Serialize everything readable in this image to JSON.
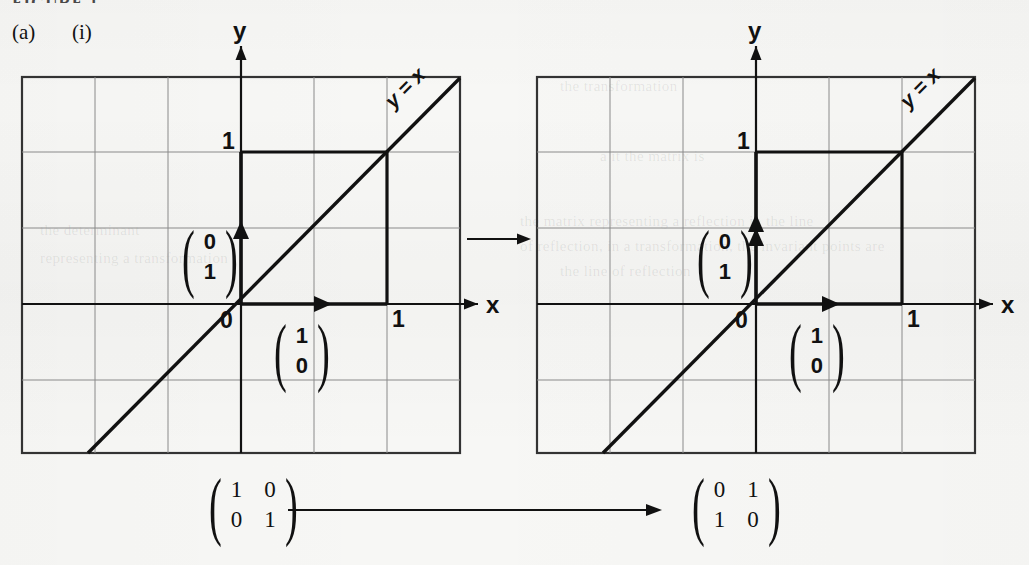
{
  "page": {
    "cropped_header": "FIGURE 1",
    "part_label": "(a)",
    "sub_label": "(i)",
    "background_color": "#f7f7f5",
    "ink_color": "#111111",
    "grid_color": "#8a8a8a"
  },
  "bleed_text": [
    {
      "text": "the transformation",
      "x": 560,
      "y": 78
    },
    {
      "text": "a it the matrix is",
      "x": 600,
      "y": 148
    },
    {
      "text": "the  matrix  representing  a  reflection  in  the  line",
      "x": 520,
      "y": 213
    },
    {
      "text": "of  reflection,  in  a  transformation,  the  invariant  points  are",
      "x": 520,
      "y": 238
    },
    {
      "text": "the  line  of  reflection",
      "x": 560,
      "y": 263
    },
    {
      "text": "the  determinant",
      "x": 40,
      "y": 222
    },
    {
      "text": "representing  a  transformation",
      "x": 40,
      "y": 250
    }
  ],
  "panels": [
    {
      "name": "identity-graph",
      "axis_x_label": "x",
      "axis_y_label": "y",
      "origin_label": "0",
      "x_tick_label": "1",
      "y_tick_label": "1",
      "line_label": "y = x",
      "vectors": [
        {
          "name": "i-hat",
          "label_top": "1",
          "label_bottom": "0",
          "dx": 1,
          "dy": 0
        },
        {
          "name": "j-hat",
          "label_top": "0",
          "label_bottom": "1",
          "dx": 0,
          "dy": 1
        }
      ],
      "unit_square": {
        "x": 1,
        "y": 1
      }
    },
    {
      "name": "reflected-graph",
      "axis_x_label": "x",
      "axis_y_label": "y",
      "origin_label": "0",
      "x_tick_label": "1",
      "y_tick_label": "1",
      "line_label": "y = x",
      "vectors": [
        {
          "name": "i-hat-image",
          "label_top": "1",
          "label_bottom": "0",
          "dx": 1,
          "dy": 0
        },
        {
          "name": "j-hat-image",
          "label_top": "0",
          "label_bottom": "1",
          "dx": 0,
          "dy": 1
        }
      ],
      "unit_square": {
        "x": 1,
        "y": 1
      }
    }
  ],
  "equation": {
    "left_matrix": {
      "r1c1": "1",
      "r1c2": "0",
      "r2c1": "0",
      "r2c2": "1"
    },
    "right_matrix": {
      "r1c1": "0",
      "r1c2": "1",
      "r2c1": "1",
      "r2c2": "0"
    },
    "arrow": "→"
  },
  "chart_data": {
    "type": "line",
    "panels": [
      {
        "label": "before",
        "xlabel": "x",
        "ylabel": "y",
        "xlim": [
          -2,
          4
        ],
        "ylim": [
          -2,
          3
        ],
        "grid": true,
        "grid_step": 1,
        "series": [
          {
            "name": "y = x",
            "type": "line",
            "points": [
              [
                -2,
                -2
              ],
              [
                3,
                3
              ]
            ]
          },
          {
            "name": "unit square outline",
            "type": "line",
            "points": [
              [
                0,
                1
              ],
              [
                1,
                1
              ],
              [
                1,
                0
              ]
            ]
          },
          {
            "name": "i-hat vector",
            "type": "arrow",
            "from": [
              0,
              0
            ],
            "to": [
              1,
              0
            ],
            "annotation": "(1, 0)"
          },
          {
            "name": "j-hat vector",
            "type": "arrow",
            "from": [
              0,
              0
            ],
            "to": [
              0,
              1
            ],
            "annotation": "(0, 1)"
          }
        ],
        "annotations": [
          "0",
          "1",
          "1",
          "y = x"
        ]
      },
      {
        "label": "after",
        "xlabel": "x",
        "ylabel": "y",
        "xlim": [
          -2,
          4
        ],
        "ylim": [
          -2,
          3
        ],
        "grid": true,
        "grid_step": 1,
        "series": [
          {
            "name": "y = x",
            "type": "line",
            "points": [
              [
                -2,
                -2
              ],
              [
                3,
                3
              ]
            ]
          },
          {
            "name": "unit square outline",
            "type": "line",
            "points": [
              [
                0,
                1
              ],
              [
                1,
                1
              ],
              [
                1,
                0
              ]
            ]
          },
          {
            "name": "i-hat image vector",
            "type": "arrow",
            "from": [
              0,
              0
            ],
            "to": [
              1,
              0
            ],
            "annotation": "(1, 0)"
          },
          {
            "name": "j-hat image vector",
            "type": "arrow",
            "from": [
              0,
              0
            ],
            "to": [
              0,
              1
            ],
            "annotation": "(0, 1)"
          }
        ],
        "annotations": [
          "0",
          "1",
          "1",
          "y = x"
        ]
      }
    ],
    "transform": {
      "from_matrix": [
        [
          1,
          0
        ],
        [
          0,
          1
        ]
      ],
      "to_matrix": [
        [
          0,
          1
        ],
        [
          1,
          0
        ]
      ]
    }
  }
}
